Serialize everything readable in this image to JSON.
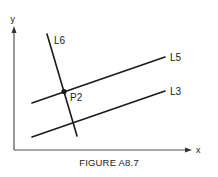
{
  "figure": {
    "caption": "FIGURE A8.7",
    "axes": {
      "x_label": "x",
      "y_label": "y"
    },
    "lines": [
      {
        "id": "L6",
        "label": "L6"
      },
      {
        "id": "L5",
        "label": "L5"
      },
      {
        "id": "L3",
        "label": "L3"
      }
    ],
    "points": [
      {
        "id": "P2",
        "label": "P2",
        "description": "intersection of L6 and L5"
      }
    ],
    "colors": {
      "stroke": "#1a1a1a",
      "axis": "#555555",
      "background": "#ffffff"
    }
  }
}
